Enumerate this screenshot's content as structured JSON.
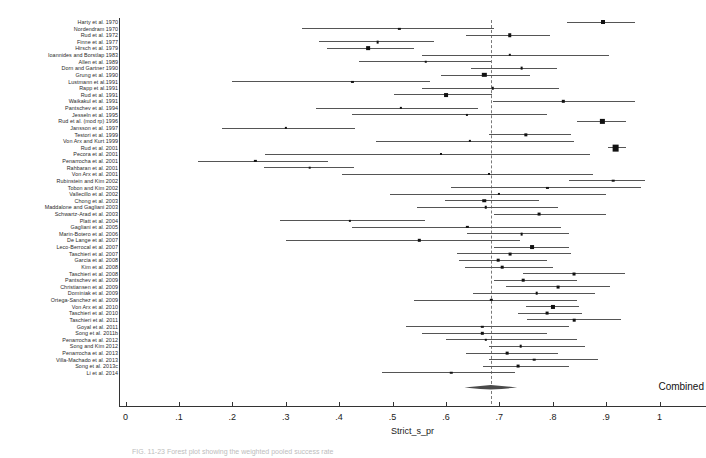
{
  "figure": {
    "caption": "FIG. 11-23  Forest plot showing the weighted pooled success rate",
    "x_axis_title": "Strict_s_pr",
    "combined_label": "Combined"
  },
  "chart_data": {
    "type": "forest",
    "title": "",
    "xlabel": "Strict_s_pr",
    "ylabel": "",
    "xlim": [
      0,
      1
    ],
    "xticks": [
      0,
      0.1,
      0.2,
      0.3,
      0.4,
      0.5,
      0.6,
      0.7,
      0.8,
      0.9,
      1
    ],
    "xticklabels": [
      "0",
      ".1",
      ".2",
      ".3",
      ".4",
      ".5",
      ".6",
      ".7",
      ".8",
      ".9",
      "1"
    ],
    "grid": false,
    "legend": "none",
    "null_line": 0.684,
    "marker_color": "#111111",
    "ci_color": "#555555",
    "null_line_color": "#7a7a7a",
    "combined": {
      "label": "Combined",
      "estimate": 0.684,
      "ci_low": 0.632,
      "ci_high": 0.731
    },
    "studies": [
      {
        "label": "Harty et al. 1970",
        "estimate": 0.895,
        "ci_low": 0.827,
        "ci_high": 0.955,
        "weight": 2.6
      },
      {
        "label": "Nordendram 1970",
        "estimate": 0.513,
        "ci_low": 0.33,
        "ci_high": 0.69,
        "weight": 1.1
      },
      {
        "label": "Rud et al. 1972",
        "estimate": 0.72,
        "ci_low": 0.638,
        "ci_high": 0.795,
        "weight": 2.2
      },
      {
        "label": "Finne et al. 1977",
        "estimate": 0.472,
        "ci_low": 0.362,
        "ci_high": 0.578,
        "weight": 1.5
      },
      {
        "label": "Hirsch et al. 1979",
        "estimate": 0.455,
        "ci_low": 0.378,
        "ci_high": 0.54,
        "weight": 2.4
      },
      {
        "label": "Ioannides and Borstlap 1983",
        "estimate": 0.72,
        "ci_low": 0.556,
        "ci_high": 0.905,
        "weight": 1.2
      },
      {
        "label": "Allen et al. 1989",
        "estimate": 0.562,
        "ci_low": 0.438,
        "ci_high": 0.684,
        "weight": 1.3
      },
      {
        "label": "Dorn and Gartner 1990",
        "estimate": 0.742,
        "ci_low": 0.647,
        "ci_high": 0.808,
        "weight": 1.5
      },
      {
        "label": "Grung et al. 1990",
        "estimate": 0.672,
        "ci_low": 0.59,
        "ci_high": 0.758,
        "weight": 2.9
      },
      {
        "label": "Lustmann et al.1991",
        "estimate": 0.425,
        "ci_low": 0.2,
        "ci_high": 0.57,
        "weight": 1.0
      },
      {
        "label": "Rapp et al.1991",
        "estimate": 0.688,
        "ci_low": 0.556,
        "ci_high": 0.812,
        "weight": 1.3
      },
      {
        "label": "Rud et al. 1991",
        "estimate": 0.6,
        "ci_low": 0.503,
        "ci_high": 0.686,
        "weight": 2.5
      },
      {
        "label": "Waikakul et al. 1991",
        "estimate": 0.82,
        "ci_low": 0.688,
        "ci_high": 0.955,
        "weight": 1.2
      },
      {
        "label": "Pantschev et al. 1994",
        "estimate": 0.515,
        "ci_low": 0.356,
        "ci_high": 0.66,
        "weight": 1.1
      },
      {
        "label": "Jesseln et al. 1995",
        "estimate": 0.64,
        "ci_low": 0.425,
        "ci_high": 0.79,
        "weight": 1.0
      },
      {
        "label": "Rud et al. (mod rp) 1996",
        "estimate": 0.893,
        "ci_low": 0.845,
        "ci_high": 0.937,
        "weight": 2.8
      },
      {
        "label": "Jansson et al. 1997",
        "estimate": 0.301,
        "ci_low": 0.18,
        "ci_high": 0.43,
        "weight": 1.1
      },
      {
        "label": "Testori et al. 1999",
        "estimate": 0.75,
        "ci_low": 0.681,
        "ci_high": 0.835,
        "weight": 2.0
      },
      {
        "label": "Von Arx and Kurt 1999",
        "estimate": 0.645,
        "ci_low": 0.47,
        "ci_high": 0.84,
        "weight": 1.1
      },
      {
        "label": "Rud et al. 2001",
        "estimate": 0.918,
        "ci_low": 0.903,
        "ci_high": 0.938,
        "weight": 5.0
      },
      {
        "label": "Pecora et al. 2001",
        "estimate": 0.59,
        "ci_low": 0.262,
        "ci_high": 0.87,
        "weight": 0.9
      },
      {
        "label": "Penarrocha et al. 2001",
        "estimate": 0.243,
        "ci_low": 0.135,
        "ci_high": 0.38,
        "weight": 1.1
      },
      {
        "label": "Rahbaran et al. 2001",
        "estimate": 0.345,
        "ci_low": 0.26,
        "ci_high": 0.428,
        "weight": 1.4
      },
      {
        "label": "Von Arx et al. 2001",
        "estimate": 0.68,
        "ci_low": 0.405,
        "ci_high": 0.875,
        "weight": 0.9
      },
      {
        "label": "Rubinstein and Kim 2002",
        "estimate": 0.913,
        "ci_low": 0.83,
        "ci_high": 0.972,
        "weight": 1.4
      },
      {
        "label": "Tobon and Kim 2002",
        "estimate": 0.79,
        "ci_low": 0.61,
        "ci_high": 0.965,
        "weight": 1.0
      },
      {
        "label": "Vallecillo et al. 2002",
        "estimate": 0.7,
        "ci_low": 0.495,
        "ci_high": 0.9,
        "weight": 1.0
      },
      {
        "label": "Chong et al. 2003",
        "estimate": 0.672,
        "ci_low": 0.598,
        "ci_high": 0.775,
        "weight": 2.2
      },
      {
        "label": "Maddalone and Gagliani 2003",
        "estimate": 0.675,
        "ci_low": 0.545,
        "ci_high": 0.81,
        "weight": 1.3
      },
      {
        "label": "Schwartz-Arad et al. 2003",
        "estimate": 0.775,
        "ci_low": 0.69,
        "ci_high": 0.9,
        "weight": 1.6
      },
      {
        "label": "Platt et al. 2004",
        "estimate": 0.42,
        "ci_low": 0.29,
        "ci_high": 0.56,
        "weight": 1.1
      },
      {
        "label": "Gagliani et al. 2005",
        "estimate": 0.64,
        "ci_low": 0.425,
        "ci_high": 0.815,
        "weight": 1.1
      },
      {
        "label": "Marin-Botero et al. 2006",
        "estimate": 0.742,
        "ci_low": 0.64,
        "ci_high": 0.83,
        "weight": 1.5
      },
      {
        "label": "De Lange et al. 2007",
        "estimate": 0.55,
        "ci_low": 0.3,
        "ci_high": 0.738,
        "weight": 1.2
      },
      {
        "label": "Leco-Berrocal et al. 2007",
        "estimate": 0.762,
        "ci_low": 0.69,
        "ci_high": 0.83,
        "weight": 2.5
      },
      {
        "label": "Taschieri et al. 2007",
        "estimate": 0.72,
        "ci_low": 0.62,
        "ci_high": 0.835,
        "weight": 1.6
      },
      {
        "label": "Garcia et al. 2008",
        "estimate": 0.698,
        "ci_low": 0.625,
        "ci_high": 0.79,
        "weight": 1.4
      },
      {
        "label": "Kim et al. 2008",
        "estimate": 0.705,
        "ci_low": 0.635,
        "ci_high": 0.8,
        "weight": 1.4
      },
      {
        "label": "Taschieri et al. 2008",
        "estimate": 0.84,
        "ci_low": 0.745,
        "ci_high": 0.935,
        "weight": 1.7
      },
      {
        "label": "Pantschev et al. 2009",
        "estimate": 0.745,
        "ci_low": 0.69,
        "ci_high": 0.845,
        "weight": 1.4
      },
      {
        "label": "Christiansen et al. 2009",
        "estimate": 0.81,
        "ci_low": 0.712,
        "ci_high": 0.908,
        "weight": 1.6
      },
      {
        "label": "Dominiak et al. 2009",
        "estimate": 0.77,
        "ci_low": 0.65,
        "ci_high": 0.88,
        "weight": 1.4
      },
      {
        "label": "Ortega-Sanchez et al. 2009",
        "estimate": 0.685,
        "ci_low": 0.54,
        "ci_high": 0.845,
        "weight": 1.2
      },
      {
        "label": "Von Arx et al. 2010",
        "estimate": 0.8,
        "ci_low": 0.75,
        "ci_high": 0.85,
        "weight": 2.7
      },
      {
        "label": "Taschieri et al. 2010",
        "estimate": 0.79,
        "ci_low": 0.735,
        "ci_high": 0.855,
        "weight": 1.6
      },
      {
        "label": "Taschieri et al. 2011",
        "estimate": 0.84,
        "ci_low": 0.752,
        "ci_high": 0.928,
        "weight": 1.4
      },
      {
        "label": "Goyal et al. 2011",
        "estimate": 0.668,
        "ci_low": 0.525,
        "ci_high": 0.83,
        "weight": 1.2
      },
      {
        "label": "Song et al. 2011b",
        "estimate": 0.668,
        "ci_low": 0.555,
        "ci_high": 0.79,
        "weight": 1.2
      },
      {
        "label": "Penarrocha et al. 2012",
        "estimate": 0.675,
        "ci_low": 0.6,
        "ci_high": 0.845,
        "weight": 1.2
      },
      {
        "label": "Song and Kim 2012",
        "estimate": 0.74,
        "ci_low": 0.68,
        "ci_high": 0.86,
        "weight": 1.4
      },
      {
        "label": "Penarrocha et al. 2013",
        "estimate": 0.715,
        "ci_low": 0.638,
        "ci_high": 0.81,
        "weight": 1.5
      },
      {
        "label": "Villa-Machado et al. 2013",
        "estimate": 0.765,
        "ci_low": 0.68,
        "ci_high": 0.885,
        "weight": 1.4
      },
      {
        "label": "Song et al. 2013c",
        "estimate": 0.735,
        "ci_low": 0.67,
        "ci_high": 0.83,
        "weight": 1.6
      },
      {
        "label": "Li et al. 2014",
        "estimate": 0.61,
        "ci_low": 0.48,
        "ci_high": 0.73,
        "weight": 1.3
      }
    ]
  }
}
